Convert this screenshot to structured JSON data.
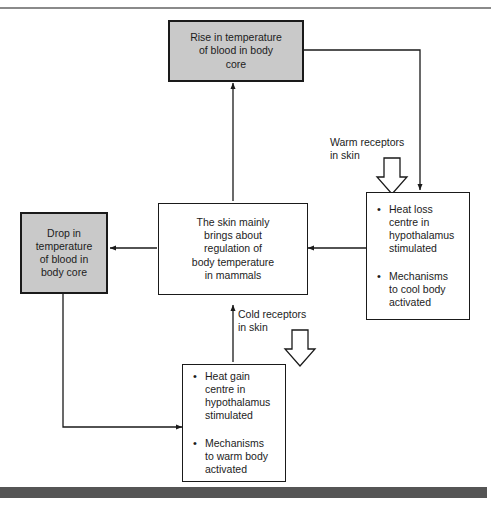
{
  "page": {
    "background_color": "#ffffff",
    "top_rule_color": "#8a8a8a",
    "bottom_bar_color": "#555555",
    "shaded_box_color": "#c9c9c9",
    "line_color": "#1a1a1a"
  },
  "boxes": {
    "rise": {
      "id": "rise-in-temperature",
      "text": "Rise in temperature\nof blood in body\ncore",
      "shaded": true
    },
    "drop": {
      "id": "drop-in-temperature",
      "text": "Drop in\ntemperature\nof blood in\nbody core",
      "shaded": true
    },
    "centre": {
      "id": "skin-regulation",
      "text": "The skin mainly\nbrings about\nregulation of\nbody temperature\nin mammals",
      "shaded": false
    },
    "heat_loss": {
      "id": "heat-loss-centre",
      "bullets": [
        "Heat loss\ncentre in\nhypothalamus\nstimulated",
        "Mechanisms\nto cool body\nactivated"
      ],
      "bullet_glyph": "•"
    },
    "heat_gain": {
      "id": "heat-gain-centre",
      "bullets": [
        "Heat gain\ncentre in\nhypothalamus\nstimulated",
        "Mechanisms\nto warm body\nactivated"
      ],
      "bullet_glyph": "•"
    }
  },
  "captions": {
    "warm_receptors": "Warm receptors\nin skin",
    "cold_receptors": "Cold receptors\nin skin"
  }
}
